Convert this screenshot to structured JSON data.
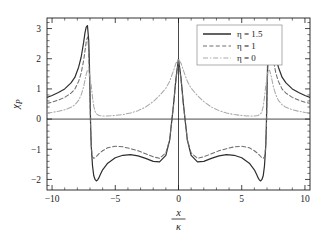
{
  "figure": {
    "background_color": "#ffffff",
    "frame_color": "#1b1b1b"
  },
  "chart_data": {
    "type": "line",
    "title": "",
    "subtitle": "",
    "xlabel_numerator": "x",
    "xlabel_denominator": "κ",
    "xlabel": "x/κ",
    "ylabel": "χ",
    "ylabel_subscript": "P",
    "xlim": [
      -10.4,
      10.4
    ],
    "ylim": [
      -2.35,
      3.35
    ],
    "grid": false,
    "legend_position": "top-right",
    "x_ticks": [
      -10,
      -5,
      0,
      5,
      10
    ],
    "x_tick_labels": [
      "−10",
      "−5",
      "0",
      "5",
      "10"
    ],
    "x_minor_step": 1,
    "y_ticks": [
      -2,
      -1,
      0,
      1,
      2,
      3
    ],
    "y_tick_labels": [
      "−2",
      "−1",
      "0",
      "1",
      "2",
      "3"
    ],
    "y_minor_step": 0.2,
    "zero_line_x": 0,
    "zero_line_y": 0,
    "series": [
      {
        "name": "η = 1.5",
        "eta": 1.5,
        "style": "solid",
        "color": "#2e2e2e",
        "legend_label": "η = 1.5",
        "x": [
          -10.4,
          -10.0,
          -9.5,
          -9.0,
          -8.5,
          -8.2,
          -7.9,
          -7.7,
          -7.5,
          -7.4,
          -7.3,
          -7.2,
          -7.1,
          -7.05,
          -7.0,
          -6.95,
          -6.9,
          -6.8,
          -6.7,
          -6.6,
          -6.5,
          -6.4,
          -6.3,
          -6.2,
          -6.0,
          -5.6,
          -5.0,
          -4.4,
          -3.8,
          -3.2,
          -2.6,
          -2.0,
          -1.5,
          -1.0,
          -0.7,
          -0.4,
          -0.2,
          0.0,
          0.2,
          0.4,
          0.7,
          1.0,
          1.5,
          2.0,
          2.6,
          3.2,
          3.8,
          4.4,
          5.0,
          5.6,
          6.0,
          6.2,
          6.3,
          6.4,
          6.5,
          6.6,
          6.7,
          6.8,
          6.9,
          6.95,
          7.0,
          7.05,
          7.1,
          7.2,
          7.3,
          7.4,
          7.5,
          7.7,
          7.9,
          8.2,
          8.5,
          9.0,
          9.5,
          10.0,
          10.4
        ],
        "y": [
          0.72,
          0.78,
          0.88,
          1.0,
          1.2,
          1.38,
          1.72,
          2.05,
          2.55,
          2.85,
          3.05,
          3.1,
          2.6,
          1.9,
          0.9,
          -0.2,
          -0.9,
          -1.55,
          -1.88,
          -2.0,
          -2.05,
          -2.02,
          -1.95,
          -1.85,
          -1.68,
          -1.46,
          -1.28,
          -1.2,
          -1.18,
          -1.22,
          -1.3,
          -1.4,
          -1.42,
          -1.2,
          -0.7,
          0.45,
          1.35,
          2.0,
          1.35,
          0.45,
          -0.7,
          -1.2,
          -1.42,
          -1.4,
          -1.3,
          -1.22,
          -1.18,
          -1.2,
          -1.28,
          -1.46,
          -1.68,
          -1.85,
          -1.95,
          -2.02,
          -2.05,
          -2.0,
          -1.88,
          -1.55,
          -0.9,
          -0.2,
          0.9,
          1.9,
          2.6,
          3.1,
          3.05,
          2.85,
          2.55,
          2.05,
          1.72,
          1.38,
          1.2,
          1.0,
          0.88,
          0.78,
          0.72
        ]
      },
      {
        "name": "η = 1",
        "eta": 1,
        "style": "dashed",
        "color": "#6e6e6e",
        "legend_label": "η = 1",
        "x": [
          -10.4,
          -10.0,
          -9.5,
          -9.0,
          -8.5,
          -8.2,
          -7.9,
          -7.7,
          -7.5,
          -7.4,
          -7.3,
          -7.2,
          -7.15,
          -7.1,
          -7.05,
          -7.0,
          -6.95,
          -6.9,
          -6.85,
          -6.8,
          -6.7,
          -6.6,
          -6.5,
          -6.3,
          -6.0,
          -5.6,
          -5.0,
          -4.4,
          -3.8,
          -3.2,
          -2.6,
          -2.0,
          -1.5,
          -1.0,
          -0.7,
          -0.4,
          -0.2,
          0.0,
          0.2,
          0.4,
          0.7,
          1.0,
          1.5,
          2.0,
          2.6,
          3.2,
          3.8,
          4.4,
          5.0,
          5.6,
          6.0,
          6.3,
          6.5,
          6.6,
          6.7,
          6.8,
          6.85,
          6.9,
          6.95,
          7.0,
          7.05,
          7.1,
          7.15,
          7.2,
          7.3,
          7.4,
          7.5,
          7.7,
          7.9,
          8.2,
          8.5,
          9.0,
          9.5,
          10.0,
          10.4
        ],
        "y": [
          0.52,
          0.56,
          0.63,
          0.72,
          0.86,
          0.99,
          1.25,
          1.52,
          1.95,
          2.25,
          2.55,
          2.72,
          2.6,
          2.2,
          1.5,
          0.6,
          -0.3,
          -0.85,
          -1.12,
          -1.25,
          -1.3,
          -1.28,
          -1.24,
          -1.15,
          -1.05,
          -0.95,
          -0.9,
          -0.92,
          -0.98,
          -1.05,
          -1.15,
          -1.25,
          -1.3,
          -1.12,
          -0.68,
          0.42,
          1.3,
          1.98,
          1.3,
          0.42,
          -0.68,
          -1.12,
          -1.3,
          -1.25,
          -1.15,
          -1.05,
          -0.98,
          -0.92,
          -0.9,
          -0.95,
          -1.05,
          -1.15,
          -1.24,
          -1.28,
          -1.3,
          -1.25,
          -1.12,
          -0.85,
          -0.3,
          0.6,
          1.5,
          2.2,
          2.6,
          2.72,
          2.55,
          2.25,
          1.95,
          1.52,
          1.25,
          0.99,
          0.86,
          0.72,
          0.63,
          0.56,
          0.52
        ]
      },
      {
        "name": "η = 0",
        "eta": 0,
        "style": "dashdot",
        "color": "#a9a9a9",
        "legend_label": "η = 0",
        "x": [
          -10.4,
          -10.0,
          -9.5,
          -9.0,
          -8.5,
          -8.2,
          -7.9,
          -7.7,
          -7.5,
          -7.4,
          -7.3,
          -7.2,
          -7.1,
          -7.0,
          -6.9,
          -6.8,
          -6.7,
          -6.6,
          -6.5,
          -6.3,
          -6.0,
          -5.6,
          -5.0,
          -4.4,
          -3.8,
          -3.2,
          -2.6,
          -2.0,
          -1.5,
          -1.0,
          -0.7,
          -0.4,
          -0.2,
          0.0,
          0.2,
          0.4,
          0.7,
          1.0,
          1.5,
          2.0,
          2.6,
          3.2,
          3.8,
          4.4,
          5.0,
          5.6,
          6.0,
          6.3,
          6.5,
          6.6,
          6.7,
          6.8,
          6.9,
          7.0,
          7.1,
          7.2,
          7.3,
          7.4,
          7.5,
          7.7,
          7.9,
          8.2,
          8.5,
          9.0,
          9.5,
          10.0,
          10.4
        ],
        "y": [
          0.2,
          0.22,
          0.26,
          0.31,
          0.39,
          0.47,
          0.62,
          0.8,
          1.08,
          1.28,
          1.48,
          1.62,
          1.6,
          1.42,
          1.1,
          0.72,
          0.42,
          0.25,
          0.18,
          0.12,
          0.1,
          0.1,
          0.12,
          0.15,
          0.2,
          0.28,
          0.4,
          0.58,
          0.78,
          1.02,
          1.25,
          1.6,
          1.85,
          1.98,
          1.85,
          1.6,
          1.25,
          1.02,
          0.78,
          0.58,
          0.4,
          0.28,
          0.2,
          0.15,
          0.12,
          0.1,
          0.1,
          0.12,
          0.18,
          0.25,
          0.42,
          0.72,
          1.1,
          1.42,
          1.6,
          1.62,
          1.48,
          1.28,
          1.08,
          0.8,
          0.62,
          0.47,
          0.39,
          0.31,
          0.26,
          0.22,
          0.2
        ]
      }
    ]
  }
}
